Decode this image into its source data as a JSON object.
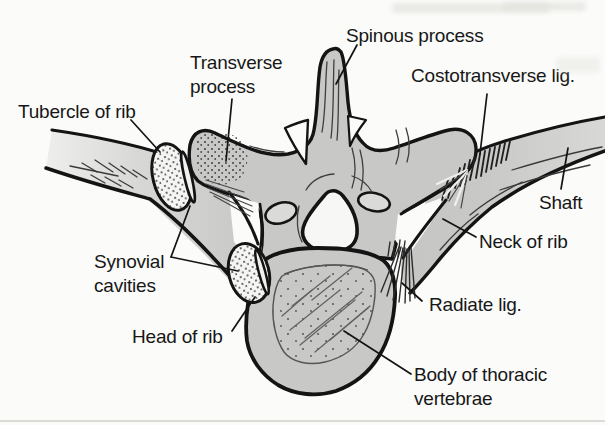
{
  "figure": {
    "labels": {
      "spinous_process": "Spinous process",
      "transverse_process": [
        "Transverse",
        "process"
      ],
      "tubercle_of_rib": "Tubercle of rib",
      "costotransverse_lig": "Costotransverse lig.",
      "shaft": "Shaft",
      "neck_of_rib": "Neck of rib",
      "synovial_cavities": [
        "Synovial",
        "cavities"
      ],
      "head_of_rib": "Head of rib",
      "radiate_lig": "Radiate lig.",
      "body_of_thoracic_vertebrae": [
        "Body of thoracic",
        "vertebrae"
      ]
    },
    "colors": {
      "background": "#fbfbfa",
      "bone_gray": "#c8c8c7",
      "outline_black": "#141414",
      "facet_white": "#f5f5f3",
      "label_text": "#171717"
    }
  }
}
